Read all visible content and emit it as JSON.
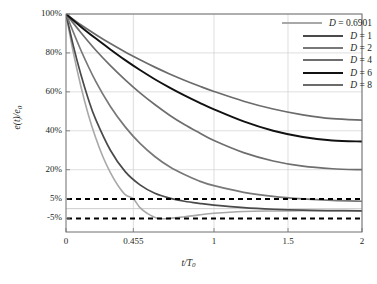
{
  "chart_data": {
    "type": "line",
    "title": "",
    "xlabel": "t/T0",
    "xlabel_main": "t",
    "xlabel_den": "T",
    "xlabel_sub": "0",
    "ylabel": "e(t)/e0",
    "ylabel_main": "e(t)/e",
    "ylabel_sub": "0",
    "xlim": [
      0,
      2
    ],
    "ylim": [
      -0.12,
      1.0
    ],
    "grid": true,
    "legend_position": "top-right",
    "xticks": [
      "0",
      "0.455",
      "1",
      "1.5",
      "2"
    ],
    "xtick_values": [
      0,
      0.455,
      1,
      1.5,
      2
    ],
    "yticks": [
      "100%",
      "80%",
      "60%",
      "40%",
      "20%",
      "5%",
      "-5%"
    ],
    "ytick_values": [
      1.0,
      0.8,
      0.6,
      0.4,
      0.2,
      0.05,
      -0.05
    ],
    "reference_lines": [
      {
        "label": "5%",
        "value": 0.05,
        "style": "dashed",
        "color": "#000000"
      },
      {
        "label": "-5%",
        "value": -0.05,
        "style": "dashed",
        "color": "#000000"
      }
    ],
    "series": [
      {
        "name": "D = 0.6901",
        "D": 0.6901,
        "color": "#a8a8a8",
        "width": 1.6,
        "x": [
          0,
          0.05,
          0.1,
          0.15,
          0.2,
          0.25,
          0.3,
          0.35,
          0.4,
          0.455,
          0.5,
          0.55,
          0.62,
          0.7,
          0.8,
          0.9,
          1.0,
          1.2,
          1.4,
          1.6,
          1.8,
          2.0
        ],
        "y": [
          1.0,
          0.8,
          0.63,
          0.485,
          0.365,
          0.265,
          0.185,
          0.12,
          0.072,
          0.05,
          0.005,
          -0.025,
          -0.05,
          -0.05,
          -0.042,
          -0.032,
          -0.024,
          -0.015,
          -0.012,
          -0.011,
          -0.011,
          -0.011
        ]
      },
      {
        "name": "D = 1",
        "D": 1,
        "color": "#4a4a4a",
        "width": 1.7,
        "x": [
          0,
          0.05,
          0.1,
          0.15,
          0.2,
          0.3,
          0.4,
          0.5,
          0.6,
          0.7,
          0.8,
          0.9,
          1.0,
          1.2,
          1.4,
          1.6,
          1.8,
          2.0
        ],
        "y": [
          1.0,
          0.835,
          0.69,
          0.565,
          0.46,
          0.3,
          0.19,
          0.122,
          0.079,
          0.054,
          0.038,
          0.027,
          0.018,
          0.005,
          -0.003,
          -0.008,
          -0.01,
          -0.011
        ]
      },
      {
        "name": "D = 2",
        "D": 2,
        "color": "#787878",
        "width": 1.7,
        "x": [
          0,
          0.1,
          0.2,
          0.3,
          0.4,
          0.5,
          0.6,
          0.7,
          0.8,
          0.9,
          1.0,
          1.2,
          1.4,
          1.6,
          1.8,
          2.0
        ],
        "y": [
          1.0,
          0.815,
          0.655,
          0.525,
          0.42,
          0.335,
          0.268,
          0.215,
          0.175,
          0.142,
          0.118,
          0.084,
          0.063,
          0.05,
          0.042,
          0.038
        ]
      },
      {
        "name": "D = 4",
        "D": 4,
        "color": "#6e6e6e",
        "width": 1.7,
        "x": [
          0,
          0.1,
          0.2,
          0.3,
          0.4,
          0.5,
          0.6,
          0.7,
          0.8,
          0.9,
          1.0,
          1.2,
          1.4,
          1.6,
          1.8,
          2.0
        ],
        "y": [
          1.0,
          0.905,
          0.815,
          0.735,
          0.662,
          0.595,
          0.535,
          0.48,
          0.432,
          0.39,
          0.35,
          0.288,
          0.245,
          0.218,
          0.205,
          0.2
        ]
      },
      {
        "name": "D = 6",
        "D": 6,
        "color": "#111111",
        "width": 1.9,
        "x": [
          0,
          0.1,
          0.2,
          0.3,
          0.4,
          0.5,
          0.6,
          0.7,
          0.8,
          0.9,
          1.0,
          1.2,
          1.4,
          1.6,
          1.8,
          2.0
        ],
        "y": [
          1.0,
          0.935,
          0.875,
          0.818,
          0.763,
          0.712,
          0.665,
          0.622,
          0.582,
          0.545,
          0.51,
          0.448,
          0.4,
          0.368,
          0.35,
          0.345
        ]
      },
      {
        "name": "D = 8",
        "D": 8,
        "color": "#6b6b6b",
        "width": 1.7,
        "x": [
          0,
          0.1,
          0.2,
          0.3,
          0.4,
          0.5,
          0.6,
          0.7,
          0.8,
          0.9,
          1.0,
          1.2,
          1.4,
          1.6,
          1.8,
          2.0
        ],
        "y": [
          1.0,
          0.945,
          0.895,
          0.848,
          0.805,
          0.765,
          0.727,
          0.692,
          0.66,
          0.63,
          0.602,
          0.552,
          0.512,
          0.482,
          0.462,
          0.455
        ]
      }
    ]
  },
  "legend": {
    "items": [
      {
        "label": "D = 0.6901",
        "letter": "D",
        "eq": " = ",
        "value": "0.6901"
      },
      {
        "label": "D = 1",
        "letter": "D",
        "eq": " = ",
        "value": "1"
      },
      {
        "label": "D = 2",
        "letter": "D",
        "eq": " = ",
        "value": "2"
      },
      {
        "label": "D = 4",
        "letter": "D",
        "eq": " = ",
        "value": "4"
      },
      {
        "label": "D = 6",
        "letter": "D",
        "eq": " = ",
        "value": "6"
      },
      {
        "label": "D = 8",
        "letter": "D",
        "eq": " = ",
        "value": "8"
      }
    ]
  },
  "axes": {
    "frame_color": "#6f6f6f",
    "grid_color": "#d0d0d0",
    "tick_label_color": "#231f20"
  }
}
